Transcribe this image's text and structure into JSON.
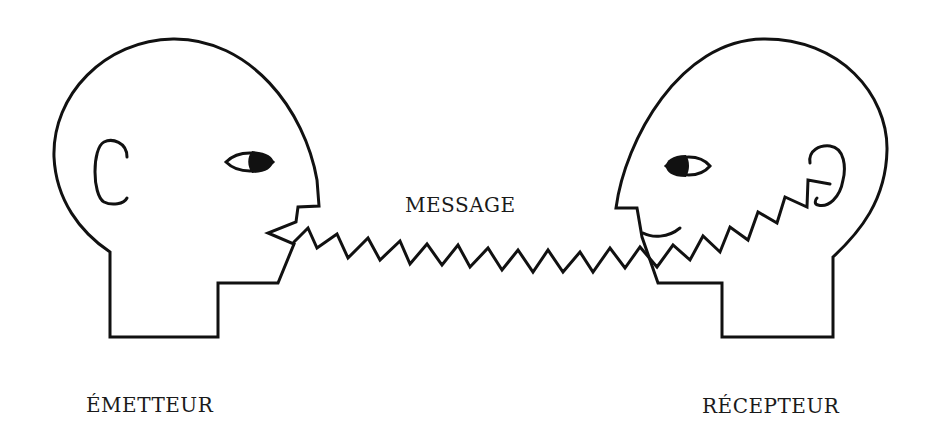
{
  "diagram": {
    "type": "communication-model",
    "labels": {
      "sender": "ÉMETTEUR",
      "message": "MESSAGE",
      "receiver": "RÉCEPTEUR"
    },
    "nodes": [
      {
        "id": "sender",
        "label": "ÉMETTEUR",
        "shape": "head-profile-facing-right",
        "position": "left"
      },
      {
        "id": "receiver",
        "label": "RÉCEPTEUR",
        "shape": "head-profile-facing-left",
        "position": "right"
      }
    ],
    "edges": [
      {
        "from": "sender",
        "to": "receiver",
        "label": "MESSAGE",
        "style": "zigzag",
        "origin": "mouth",
        "target": "ear"
      }
    ],
    "colors": {
      "line": "#111111",
      "background": "#ffffff",
      "text": "#1a1a1a"
    }
  }
}
